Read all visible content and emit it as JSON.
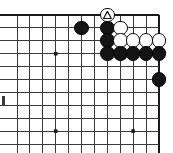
{
  "diagram": {
    "type": "go-board-diagram",
    "title": "Go board corner diagram",
    "board": {
      "columns": 11,
      "rows": 11,
      "cell": 12.9,
      "origin_x": 17,
      "origin_y": 15,
      "line_color": "#3a3a3a",
      "border_color": "#1a1a1a",
      "background_color": "#ffffff",
      "edges": {
        "top": true,
        "right": true,
        "left": false,
        "bottom": false
      },
      "star_points": [
        {
          "col": 3,
          "row": 3
        },
        {
          "col": 3,
          "row": 9
        },
        {
          "col": 9,
          "row": 9
        }
      ]
    },
    "stones": [
      {
        "id": "b1",
        "color": "black",
        "col": 5,
        "row": 1,
        "label": ""
      },
      {
        "id": "b2",
        "color": "black",
        "col": 7,
        "row": 1,
        "label": ""
      },
      {
        "id": "w1",
        "color": "white",
        "col": 8,
        "row": 1,
        "label": ""
      },
      {
        "id": "b3",
        "color": "black",
        "col": 7,
        "row": 2,
        "label": ""
      },
      {
        "id": "w2",
        "color": "white",
        "col": 8,
        "row": 2,
        "label": ""
      },
      {
        "id": "w3",
        "color": "white",
        "col": 9,
        "row": 2,
        "label": ""
      },
      {
        "id": "w4",
        "color": "white",
        "col": 10,
        "row": 2,
        "label": ""
      },
      {
        "id": "w5",
        "color": "white",
        "col": 11,
        "row": 2,
        "label": ""
      },
      {
        "id": "b4",
        "color": "black",
        "col": 7,
        "row": 3,
        "label": ""
      },
      {
        "id": "b5",
        "color": "black",
        "col": 8,
        "row": 3,
        "label": ""
      },
      {
        "id": "b6",
        "color": "black",
        "col": 9,
        "row": 3,
        "label": ""
      },
      {
        "id": "b7",
        "color": "black",
        "col": 10,
        "row": 3,
        "label": ""
      },
      {
        "id": "b8",
        "color": "black",
        "col": 11,
        "row": 3,
        "label": ""
      },
      {
        "id": "b9",
        "color": "black",
        "col": 11,
        "row": 5,
        "label": ""
      }
    ],
    "marked_stone": {
      "id": "wTri",
      "color": "white",
      "col": 7,
      "row": 0,
      "mark": "triangle",
      "mark_color": "#111111",
      "note": "triangle-marked white stone on top edge"
    },
    "artifact": {
      "name": "left-edge-tick",
      "x": 2,
      "y": 96,
      "width": 3,
      "height": 9
    }
  }
}
